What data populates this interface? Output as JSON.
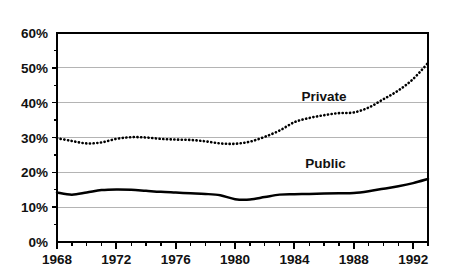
{
  "chart_data": {
    "type": "line",
    "title": "",
    "subtitle": "",
    "xlabel": "",
    "ylabel": "",
    "xlim": [
      1968,
      1993
    ],
    "ylim": [
      0,
      60
    ],
    "grid": true,
    "grid_axis": "y",
    "legend_position": "inline-annotation",
    "y_ticks": [
      0,
      10,
      20,
      30,
      40,
      50,
      60
    ],
    "y_tick_labels": [
      "0%",
      "10%",
      "20%",
      "30%",
      "40%",
      "50%",
      "60%"
    ],
    "x_ticks": [
      1968,
      1969,
      1970,
      1971,
      1972,
      1973,
      1974,
      1975,
      1976,
      1977,
      1978,
      1979,
      1980,
      1981,
      1982,
      1983,
      1984,
      1985,
      1986,
      1987,
      1988,
      1989,
      1990,
      1991,
      1992,
      1993
    ],
    "x_tick_labels": [
      "1968",
      "1972",
      "1976",
      "1980",
      "1984",
      "1988",
      "1992"
    ],
    "x_labeled_ticks": [
      1968,
      1972,
      1976,
      1980,
      1984,
      1988,
      1992
    ],
    "x": [
      1968,
      1969,
      1970,
      1971,
      1972,
      1973,
      1974,
      1975,
      1976,
      1977,
      1978,
      1979,
      1980,
      1981,
      1982,
      1983,
      1984,
      1985,
      1986,
      1987,
      1988,
      1989,
      1990,
      1991,
      1992,
      1993
    ],
    "series": [
      {
        "name": "Private",
        "style": "dotted",
        "color": "#000000",
        "label": "Private",
        "values": [
          29.8,
          29.0,
          28.3,
          28.6,
          29.6,
          30.1,
          30.0,
          29.6,
          29.4,
          29.3,
          28.9,
          28.3,
          28.2,
          28.8,
          30.2,
          32.0,
          34.4,
          35.6,
          36.4,
          37.0,
          37.2,
          38.6,
          41.0,
          43.5,
          46.8,
          51.4
        ]
      },
      {
        "name": "Public",
        "style": "solid",
        "color": "#000000",
        "label": "Public",
        "values": [
          14.2,
          13.6,
          14.2,
          14.9,
          15.1,
          15.0,
          14.7,
          14.4,
          14.2,
          14.0,
          13.8,
          13.4,
          12.3,
          12.2,
          12.9,
          13.6,
          13.7,
          13.8,
          13.9,
          14.0,
          14.1,
          14.6,
          15.3,
          16.0,
          16.9,
          18.1
        ]
      }
    ],
    "annotations": [
      {
        "text": "Private",
        "x": 1986.0,
        "y": 40.4
      },
      {
        "text": "Public",
        "x": 1986.1,
        "y": 21.2
      }
    ]
  }
}
